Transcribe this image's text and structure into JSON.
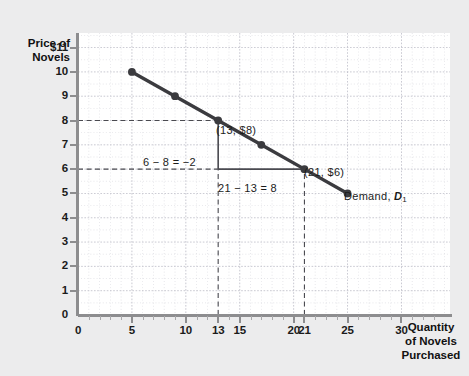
{
  "chart_data": {
    "type": "line",
    "title": "",
    "xlabel": "Quantity of Novels Purchased",
    "ylabel": "Price of Novels",
    "xlim": [
      0,
      34.5
    ],
    "ylim": [
      0,
      11.6
    ],
    "grid": true,
    "legend_position": "inline-right",
    "series": [
      {
        "name": "Demand, D1",
        "points": [
          {
            "x": 5,
            "y": 10
          },
          {
            "x": 9,
            "y": 9
          },
          {
            "x": 13,
            "y": 8
          },
          {
            "x": 17,
            "y": 7
          },
          {
            "x": 21,
            "y": 6
          },
          {
            "x": 25,
            "y": 5
          }
        ]
      }
    ],
    "x_ticks": [
      {
        "value": 0,
        "label": "0"
      },
      {
        "value": 5,
        "label": "5"
      },
      {
        "value": 10,
        "label": "10"
      },
      {
        "value": 13,
        "label": "13"
      },
      {
        "value": 15,
        "label": "15"
      },
      {
        "value": 20,
        "label": "20"
      },
      {
        "value": 21,
        "label": "21"
      },
      {
        "value": 25,
        "label": "25"
      },
      {
        "value": 30,
        "label": "30"
      }
    ],
    "y_ticks": [
      {
        "value": 11,
        "label": "$11"
      },
      {
        "value": 10,
        "label": "10"
      },
      {
        "value": 9,
        "label": "9"
      },
      {
        "value": 8,
        "label": "8"
      },
      {
        "value": 7,
        "label": "7"
      },
      {
        "value": 6,
        "label": "6"
      },
      {
        "value": 5,
        "label": "5"
      },
      {
        "value": 4,
        "label": "4"
      },
      {
        "value": 3,
        "label": "3"
      },
      {
        "value": 2,
        "label": "2"
      },
      {
        "value": 1,
        "label": "1"
      },
      {
        "value": 0,
        "label": "0"
      }
    ],
    "annotations": {
      "point_13": "(13, $8)",
      "point_21": "(21, $6)",
      "rise": "6 − 8 = −2",
      "run": "21 − 13 = 8",
      "curve_label_text": "Demand, ",
      "curve_label_symbol": "D",
      "curve_label_subscript": "1"
    },
    "reference_lines": [
      {
        "type": "horizontal",
        "y": 8,
        "from_x": 0,
        "to_x": 13,
        "style": "dashed"
      },
      {
        "type": "horizontal",
        "y": 6,
        "from_x": 0,
        "to_x": 13,
        "style": "dashed"
      },
      {
        "type": "horizontal",
        "y": 6,
        "from_x": 13,
        "to_x": 21,
        "style": "solid"
      },
      {
        "type": "vertical",
        "x": 13,
        "from_y": 6,
        "to_y": 8,
        "style": "solid"
      },
      {
        "type": "vertical",
        "x": 13,
        "from_y": 0,
        "to_y": 6,
        "style": "dashed"
      },
      {
        "type": "vertical",
        "x": 21,
        "from_y": 0,
        "to_y": 6,
        "style": "dashed"
      }
    ],
    "colors": {
      "curve": "#3b3b3f",
      "grid": "#b9b9c4",
      "axis": "#8d8d8f",
      "background": "#ececed",
      "plot_background": "#ffffff",
      "text": "#1b1b1b"
    }
  },
  "axis_titles": {
    "y_line_1": "Price of",
    "y_line_2": "Novels",
    "x_line_1": "Quantity",
    "x_line_2": "of Novels",
    "x_line_3": "Purchased"
  }
}
